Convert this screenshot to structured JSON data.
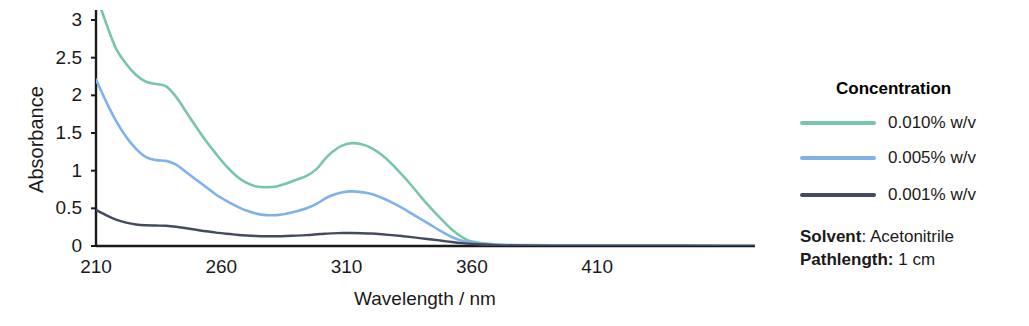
{
  "chart_data": {
    "type": "line",
    "title": "",
    "xlabel": "Wavelength / nm",
    "ylabel": "Absorbance",
    "xlim": [
      210,
      473
    ],
    "ylim": [
      0,
      3.15
    ],
    "xticks": [
      210,
      260,
      310,
      360,
      410
    ],
    "yticks": [
      0,
      0.5,
      1,
      1.5,
      2,
      2.5,
      3
    ],
    "xtick_labels": [
      "210",
      "260",
      "310",
      "360",
      "410"
    ],
    "ytick_labels": [
      "0",
      "0.5",
      "1",
      "1.5",
      "2",
      "2.5",
      "3"
    ],
    "grid": false,
    "legend_position": "right",
    "legend_title": "Concentration",
    "x": [
      210,
      214,
      218,
      222,
      226,
      230,
      234,
      238,
      242,
      246,
      250,
      254,
      258,
      262,
      266,
      270,
      274,
      278,
      282,
      286,
      290,
      294,
      298,
      301,
      304,
      308,
      312,
      316,
      320,
      324,
      328,
      332,
      336,
      340,
      344,
      348,
      352,
      356,
      360,
      370,
      380,
      400,
      420,
      440,
      460,
      473
    ],
    "series": [
      {
        "name": "0.010% w/v",
        "color": "#79c4ae",
        "values": [
          3.35,
          2.96,
          2.62,
          2.42,
          2.27,
          2.18,
          2.15,
          2.12,
          1.98,
          1.78,
          1.58,
          1.39,
          1.22,
          1.06,
          0.93,
          0.84,
          0.79,
          0.78,
          0.79,
          0.83,
          0.88,
          0.93,
          1.02,
          1.14,
          1.24,
          1.33,
          1.365,
          1.35,
          1.3,
          1.21,
          1.09,
          0.95,
          0.8,
          0.64,
          0.49,
          0.35,
          0.22,
          0.12,
          0.06,
          0.02,
          0.012,
          0.008,
          0.006,
          0.005,
          0.004,
          0.004
        ]
      },
      {
        "name": "0.005% w/v",
        "color": "#7fb2e8",
        "values": [
          2.21,
          1.92,
          1.66,
          1.45,
          1.29,
          1.18,
          1.14,
          1.13,
          1.08,
          0.98,
          0.88,
          0.78,
          0.68,
          0.6,
          0.53,
          0.47,
          0.43,
          0.41,
          0.41,
          0.43,
          0.46,
          0.5,
          0.56,
          0.62,
          0.67,
          0.71,
          0.725,
          0.715,
          0.69,
          0.64,
          0.58,
          0.51,
          0.43,
          0.35,
          0.27,
          0.19,
          0.12,
          0.07,
          0.04,
          0.015,
          0.008,
          0.005,
          0.004,
          0.003,
          0.003,
          0.003
        ]
      },
      {
        "name": "0.001% w/v",
        "color": "#444b5e",
        "values": [
          0.48,
          0.41,
          0.35,
          0.31,
          0.285,
          0.275,
          0.272,
          0.268,
          0.255,
          0.235,
          0.215,
          0.195,
          0.178,
          0.162,
          0.15,
          0.14,
          0.133,
          0.13,
          0.13,
          0.133,
          0.138,
          0.145,
          0.155,
          0.163,
          0.168,
          0.172,
          0.173,
          0.17,
          0.165,
          0.156,
          0.145,
          0.132,
          0.118,
          0.102,
          0.086,
          0.07,
          0.053,
          0.038,
          0.026,
          0.012,
          0.007,
          0.004,
          0.003,
          0.003,
          0.002,
          0.002
        ]
      }
    ],
    "annotations": [
      {
        "key": "Solvent",
        "separator": ":",
        "value": "Acetonitrile"
      },
      {
        "key": "Pathlength:",
        "separator": "",
        "value": "1 cm"
      }
    ]
  },
  "axis": {
    "y_title": "Absorbance",
    "x_title": "Wavelength / nm"
  },
  "legend": {
    "title": "Concentration",
    "items": [
      {
        "label": "0.010% w/v",
        "color": "#79c4ae"
      },
      {
        "label": "0.005% w/v",
        "color": "#7fb2e8"
      },
      {
        "label": "0.001% w/v",
        "color": "#444b5e"
      }
    ]
  },
  "info": {
    "solvent_key": "Solvent",
    "solvent_sep": ": ",
    "solvent_value": "Acetonitrile",
    "pathlength_key": "Pathlength:",
    "pathlength_sep": " ",
    "pathlength_value": "1 cm"
  },
  "colors": {
    "axis": "#1a1a1a",
    "background": "#ffffff"
  }
}
